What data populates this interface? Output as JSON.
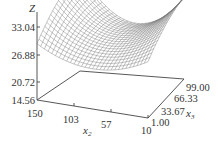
{
  "chart_data": {
    "type": "surface3d",
    "title": "",
    "style": "wireframe mesh",
    "xlabel": "x2",
    "ylabel": "x3",
    "zlabel": "Z",
    "x_axis": {
      "label": "x",
      "subscript": "2",
      "ticks": [
        "150",
        "103",
        "57",
        "10"
      ],
      "range": [
        150,
        10
      ]
    },
    "y_axis": {
      "label": "x",
      "subscript": "3",
      "ticks": [
        "1.00",
        "33.67",
        "66.33",
        "99.00"
      ],
      "range": [
        1.0,
        99.0
      ]
    },
    "z_axis": {
      "label": "Z",
      "ticks": [
        "33.04",
        "26.88",
        "20.72",
        "14.56"
      ],
      "range": [
        14.56,
        33.04
      ]
    },
    "grid": false,
    "legend": null,
    "surface_description": "Saddle-shaped surface: high (~33) near x2=150 and x2=10 at the back, dipping to a saddle near mid x2 (~80) and falling toward ~22 at front-right",
    "mesh_color": "#7a7a7a",
    "axis_color": "#444444"
  }
}
